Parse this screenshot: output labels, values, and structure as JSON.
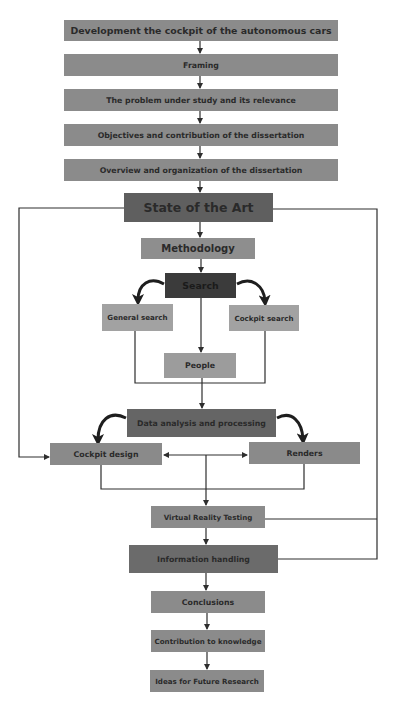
{
  "diagram": {
    "type": "flowchart",
    "colors": {
      "main": "#8b8b8b",
      "state_of_art": "#5f5f5f",
      "methodology": "#8e8e8e",
      "search": "#3b3b3b",
      "search_branch": "#a2a2a2",
      "people": "#9c9c9c",
      "data_analysis": "#656565",
      "design": "#8a8a8a",
      "info_handling": "#6b6b6b",
      "line": "#2e2e2e"
    },
    "nodes": {
      "development": "Development the cockpit of the autonomous cars",
      "framing": "Framing",
      "problem": "The problem under study and its relevance",
      "objectives": "Objectives and contribution of the dissertation",
      "overview": "Overview and organization of the dissertation",
      "state_of_art": "State of the Art",
      "methodology": "Methodology",
      "search": "Search",
      "general_search": "General search",
      "cockpit_search": "Cockpit search",
      "people": "People",
      "data_analysis": "Data analysis and processing",
      "cockpit_design": "Cockpit design",
      "renders": "Renders",
      "vr_testing": "Virtual Reality Testing",
      "info_handling": "Information handling",
      "conclusions": "Conclusions",
      "contribution": "Contribution to knowledge",
      "ideas": "Ideas for Future Research"
    },
    "edges": [
      [
        "development",
        "framing"
      ],
      [
        "framing",
        "problem"
      ],
      [
        "problem",
        "objectives"
      ],
      [
        "objectives",
        "overview"
      ],
      [
        "overview",
        "state_of_art"
      ],
      [
        "state_of_art",
        "methodology"
      ],
      [
        "methodology",
        "search"
      ],
      [
        "search",
        "general_search"
      ],
      [
        "search",
        "cockpit_search"
      ],
      [
        "search",
        "people"
      ],
      [
        "general_search",
        "data_analysis"
      ],
      [
        "cockpit_search",
        "data_analysis"
      ],
      [
        "people",
        "data_analysis"
      ],
      [
        "data_analysis",
        "cockpit_design"
      ],
      [
        "data_analysis",
        "renders"
      ],
      [
        "cockpit_design",
        "renders"
      ],
      [
        "renders",
        "cockpit_design"
      ],
      [
        "state_of_art",
        "cockpit_design"
      ],
      [
        "cockpit_design",
        "vr_testing"
      ],
      [
        "renders",
        "vr_testing"
      ],
      [
        "vr_testing",
        "info_handling"
      ],
      [
        "vr_testing",
        "state_of_art"
      ],
      [
        "info_handling",
        "state_of_art"
      ],
      [
        "info_handling",
        "conclusions"
      ],
      [
        "conclusions",
        "contribution"
      ],
      [
        "contribution",
        "ideas"
      ]
    ]
  }
}
